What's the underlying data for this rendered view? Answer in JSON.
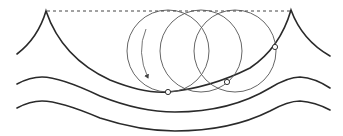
{
  "diagram": {
    "colors": {
      "line": "#2a2a2a",
      "circle": "#555555",
      "background": "#ffffff"
    },
    "elements": {
      "still_water_line": "dashed-line",
      "surface_wave": "trochoid-wave",
      "subsurface_waves": [
        "wave-level-2",
        "wave-level-3"
      ],
      "orbit_circles": 3,
      "particle_markers": 3,
      "rotation_arrow": "clockwise"
    }
  }
}
